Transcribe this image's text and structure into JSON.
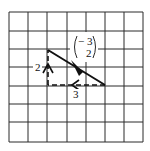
{
  "diagram": {
    "type": "vector-on-grid",
    "grid": {
      "columns": 7,
      "rows": 7,
      "origin_px": [
        9,
        12
      ],
      "cell_w": 19,
      "cell_h": 18.6,
      "line_color": "#2b2b2b"
    },
    "column_vector": {
      "top": "− 3",
      "bottom": "2"
    },
    "resultant": {
      "from": [
        2,
        2
      ],
      "to": [
        5,
        4
      ],
      "style": "solid",
      "arrowhead": "filled-mid"
    },
    "components": [
      {
        "name": "horizontal",
        "from": [
          5,
          4
        ],
        "to": [
          2,
          4
        ],
        "style": "dashed",
        "label": "3",
        "arrowhead": "open-chevron-left"
      },
      {
        "name": "vertical",
        "from": [
          2,
          4
        ],
        "to": [
          2,
          2
        ],
        "style": "dashed",
        "label": "2",
        "arrowhead": "open-chevron-up"
      }
    ]
  }
}
